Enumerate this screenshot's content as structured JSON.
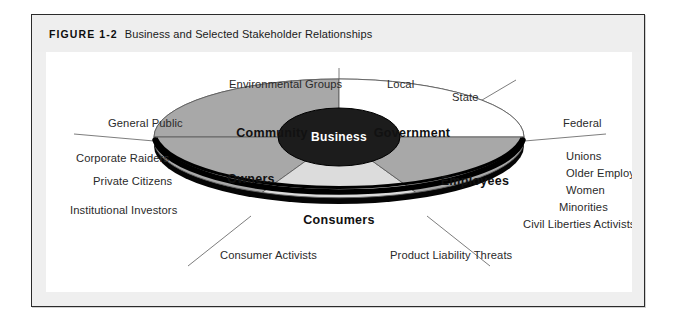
{
  "figure": {
    "number": "FIGURE 1-2",
    "title": "Business and Selected Stakeholder Relationships"
  },
  "core": {
    "label": "Business"
  },
  "sectors": [
    {
      "key": "community",
      "label": "Community",
      "fill": "#a8a8a8"
    },
    {
      "key": "government",
      "label": "Government",
      "fill": "#ffffff"
    },
    {
      "key": "employees",
      "label": "Employees",
      "fill": "#a8a8a8"
    },
    {
      "key": "consumers",
      "label": "Consumers",
      "fill": "#dcdcdc"
    },
    {
      "key": "owners",
      "label": "Owners",
      "fill": "#a8a8a8"
    }
  ],
  "stakeholders": {
    "community": [
      "Environmental Groups",
      "General Public"
    ],
    "government": [
      "Local",
      "State",
      "Federal"
    ],
    "employees": [
      "Unions",
      "Older Employees",
      "Women",
      "Minorities",
      "Civil Liberties Activists"
    ],
    "consumers": [
      "Consumer Activists",
      "Product Liability Threats"
    ],
    "owners": [
      "Corporate Raiders",
      "Private Citizens",
      "Institutional Investors"
    ]
  },
  "outer_labels": [
    {
      "name": "environmental-groups",
      "text": "Environmental Groups",
      "x": 183,
      "y": 36,
      "anchor": "start"
    },
    {
      "name": "local",
      "text": "Local",
      "x": 341,
      "y": 36,
      "anchor": "start"
    },
    {
      "name": "state",
      "text": "State",
      "x": 406,
      "y": 49,
      "anchor": "start"
    },
    {
      "name": "general-public",
      "text": "General Public",
      "x": 62,
      "y": 75,
      "anchor": "start"
    },
    {
      "name": "federal",
      "text": "Federal",
      "x": 517,
      "y": 75,
      "anchor": "start"
    },
    {
      "name": "corporate-raiders",
      "text": "Corporate Raiders",
      "x": 30,
      "y": 110,
      "anchor": "start"
    },
    {
      "name": "unions",
      "text": "Unions",
      "x": 520,
      "y": 108,
      "anchor": "start"
    },
    {
      "name": "older-employees",
      "text": "Older Employees",
      "x": 520,
      "y": 125,
      "anchor": "start"
    },
    {
      "name": "private-citizens",
      "text": "Private Citizens",
      "x": 47,
      "y": 133,
      "anchor": "start"
    },
    {
      "name": "women",
      "text": "Women",
      "x": 520,
      "y": 142,
      "anchor": "start"
    },
    {
      "name": "institutional-investors",
      "text": "Institutional Investors",
      "x": 24,
      "y": 162,
      "anchor": "start"
    },
    {
      "name": "minorities",
      "text": "Minorities",
      "x": 513,
      "y": 159,
      "anchor": "start"
    },
    {
      "name": "civil-liberties-activists",
      "text": "Civil Liberties Activists",
      "x": 477,
      "y": 176,
      "anchor": "start"
    },
    {
      "name": "consumer-activists",
      "text": "Consumer Activists",
      "x": 174,
      "y": 207,
      "anchor": "start"
    },
    {
      "name": "product-liability-threats",
      "text": "Product Liability Threats",
      "x": 344,
      "y": 207,
      "anchor": "start"
    }
  ],
  "sector_label_positions": [
    {
      "key": "community",
      "x": 226,
      "y": 85
    },
    {
      "key": "government",
      "x": 351,
      "y": 85
    },
    {
      "key": "owners",
      "x": 205,
      "y": 131
    },
    {
      "key": "employees",
      "x": 429,
      "y": 133
    },
    {
      "key": "consumers",
      "x": 293,
      "y": 172
    }
  ],
  "colors": {
    "frame_border": "#2b2b2b",
    "header_band": "#eeeeee",
    "canvas": "#ffffff",
    "core_fill": "#1c1c1c",
    "sector_mid": "#a8a8a8",
    "sector_light": "#dcdcdc",
    "sector_white": "#ffffff",
    "disc_edge": "#000000",
    "leader_line": "#6e6e6e"
  }
}
